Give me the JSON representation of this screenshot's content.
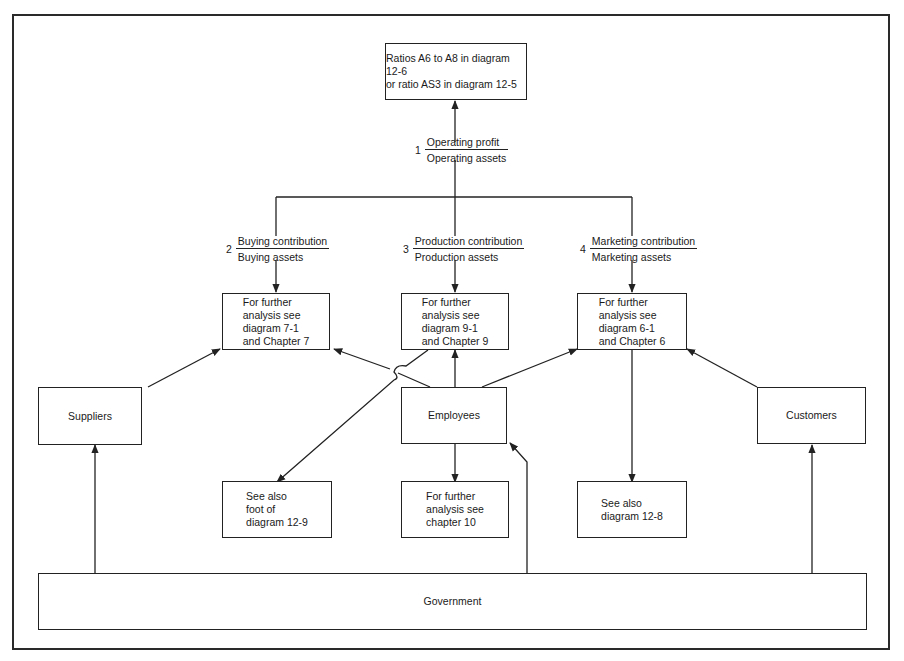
{
  "diagram": {
    "top_box": {
      "label": "Ratios A6 to A8 in diagram 12-6\nor ratio AS3 in diagram 12-5"
    },
    "ratios": [
      {
        "number": "1",
        "numerator": "Operating profit",
        "denominator": "Operating assets"
      },
      {
        "number": "2",
        "numerator": "Buying contribution",
        "denominator": "Buying assets"
      },
      {
        "number": "3",
        "numerator": "Production contribution",
        "denominator": "Production assets"
      },
      {
        "number": "4",
        "numerator": "Marketing contribution",
        "denominator": "Marketing assets"
      }
    ],
    "analysis_boxes": [
      {
        "label": "For further\nanalysis see\ndiagram 7-1\nand Chapter 7"
      },
      {
        "label": "For further\nanalysis see\ndiagram 9-1\nand Chapter 9"
      },
      {
        "label": "For further\nanalysis see\ndiagram 6-1\nand Chapter 6"
      }
    ],
    "stakeholders": {
      "suppliers": "Suppliers",
      "employees": "Employees",
      "customers": "Customers",
      "government": "Government"
    },
    "reference_boxes": [
      {
        "label": "See also\nfoot of\ndiagram 12-9"
      },
      {
        "label": "For further\nanalysis see\nchapter 10"
      },
      {
        "label": "See also\ndiagram 12-8"
      }
    ],
    "colors": {
      "line": "#222222",
      "background": "#ffffff"
    }
  }
}
